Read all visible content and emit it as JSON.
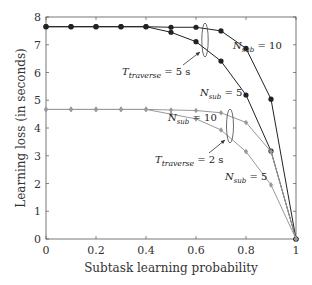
{
  "chart_data": {
    "type": "line",
    "title": "",
    "xlabel": "Subtask learning probability",
    "ylabel": "Learning loss (in seconds)",
    "xlim": [
      0,
      1
    ],
    "ylim": [
      0,
      8
    ],
    "xticks": [
      "0",
      "0.2",
      "0.4",
      "0.6",
      "0.8",
      "1"
    ],
    "yticks": [
      "0",
      "1",
      "2",
      "3",
      "4",
      "5",
      "6",
      "7",
      "8"
    ],
    "grid": false,
    "legend": null,
    "x": [
      0,
      0.1,
      0.2,
      0.3,
      0.4,
      0.5,
      0.6,
      0.7,
      0.8,
      0.9,
      1.0
    ],
    "series": [
      {
        "name": "T_traverse = 5 s, N_sub = 10",
        "color": "#222222",
        "marker": "circle",
        "values": [
          7.65,
          7.65,
          7.65,
          7.65,
          7.65,
          7.63,
          7.63,
          7.5,
          6.87,
          5.04,
          0
        ]
      },
      {
        "name": "T_traverse = 5 s, N_sub = 5",
        "color": "#222222",
        "marker": "circle",
        "values": [
          7.65,
          7.65,
          7.65,
          7.65,
          7.65,
          7.45,
          7.11,
          6.41,
          5.19,
          3.17,
          0
        ]
      },
      {
        "name": "T_traverse = 2 s, N_sub = 10",
        "color": "#999999",
        "marker": "diamond",
        "values": [
          4.67,
          4.67,
          4.67,
          4.67,
          4.67,
          4.65,
          4.63,
          4.55,
          4.2,
          3.15,
          0
        ]
      },
      {
        "name": "T_traverse = 2 s, N_sub = 5",
        "color": "#999999",
        "marker": "diamond",
        "values": [
          4.67,
          4.67,
          4.67,
          4.67,
          4.67,
          4.5,
          4.33,
          3.93,
          3.15,
          1.95,
          0
        ]
      }
    ],
    "annotations": [
      {
        "text_main": "T",
        "text_sub": "traverse",
        "text_tail": " = 5 s",
        "target": "black curves"
      },
      {
        "text_main": "T",
        "text_sub": "traverse",
        "text_tail": " = 2 s",
        "target": "grey curves"
      },
      {
        "text_main": "N",
        "text_sub": "sub",
        "text_tail": " = 10",
        "target": "black N_sub=10"
      },
      {
        "text_main": "N",
        "text_sub": "sub",
        "text_tail": " = 5",
        "target": "black N_sub=5"
      },
      {
        "text_main": "N",
        "text_sub": "sub",
        "text_tail": " = 10",
        "target": "grey N_sub=10"
      },
      {
        "text_main": "N",
        "text_sub": "sub",
        "text_tail": " = 5",
        "target": "grey N_sub=5"
      }
    ]
  }
}
